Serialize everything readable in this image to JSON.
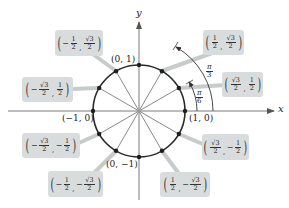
{
  "diagram": {
    "axes": {
      "x_label": "x",
      "y_label": "y"
    },
    "axis_points": [
      {
        "id": "top",
        "label": "(0, 1)"
      },
      {
        "id": "left",
        "label": "(−1, 0)"
      },
      {
        "id": "right",
        "label": "(1, 0)"
      },
      {
        "id": "bottom",
        "label": "(0, −1)"
      }
    ],
    "angles": [
      {
        "id": "pi6",
        "num": "π",
        "den": "6"
      },
      {
        "id": "pi3",
        "num": "π",
        "den": "3"
      }
    ],
    "coordinate_boxes": [
      {
        "id": "q1-60",
        "x_sign": "",
        "x_num": "1",
        "x_den": "2",
        "y_sign": "",
        "y_num": "√3",
        "y_den": "2"
      },
      {
        "id": "q1-30",
        "x_sign": "",
        "x_num": "√3",
        "x_den": "2",
        "y_sign": "",
        "y_num": "1",
        "y_den": "2"
      },
      {
        "id": "q2-120",
        "x_sign": "−",
        "x_num": "1",
        "x_den": "2",
        "y_sign": "",
        "y_num": "√3",
        "y_den": "2"
      },
      {
        "id": "q2-150",
        "x_sign": "−",
        "x_num": "√3",
        "x_den": "2",
        "y_sign": "",
        "y_num": "1",
        "y_den": "2"
      },
      {
        "id": "q3-210",
        "x_sign": "−",
        "x_num": "√3",
        "x_den": "2",
        "y_sign": "−",
        "y_num": "1",
        "y_den": "2"
      },
      {
        "id": "q3-240",
        "x_sign": "−",
        "x_num": "1",
        "x_den": "2",
        "y_sign": "−",
        "y_num": "√3",
        "y_den": "2"
      },
      {
        "id": "q4-330",
        "x_sign": "",
        "x_num": "√3",
        "x_den": "2",
        "y_sign": "−",
        "y_num": "1",
        "y_den": "2"
      },
      {
        "id": "q4-300",
        "x_sign": "",
        "x_num": "1",
        "x_den": "2",
        "y_sign": "−",
        "y_num": "√3",
        "y_den": "2"
      }
    ],
    "colors": {
      "circle": "#2a2a2a",
      "spoke": "#8a8a8a",
      "axis": "#7a7a7a",
      "box_fill": "#d9dcdc",
      "leader": "#c8cbcb",
      "dot": "#1e1e1e"
    }
  }
}
